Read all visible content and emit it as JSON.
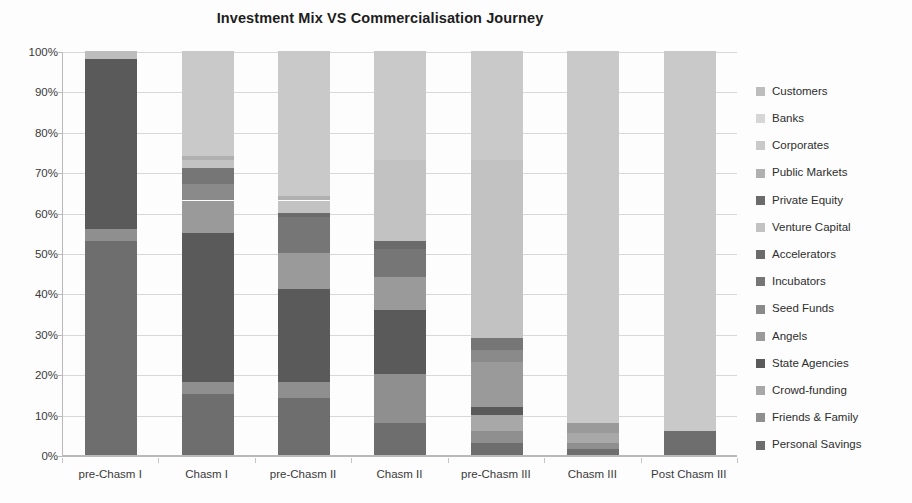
{
  "chart_data": {
    "type": "bar",
    "subtype": "100% stacked bar",
    "title": "Investment Mix VS Commercialisation Journey",
    "xlabel": "",
    "ylabel": "",
    "ylim": [
      0,
      100
    ],
    "ytick_labels": [
      "0%",
      "10%",
      "20%",
      "30%",
      "40%",
      "50%",
      "60%",
      "70%",
      "80%",
      "90%",
      "100%"
    ],
    "ytick_values": [
      0,
      10,
      20,
      30,
      40,
      50,
      60,
      70,
      80,
      90,
      100
    ],
    "grid": true,
    "legend_position": "right",
    "categories": [
      "pre-Chasm I",
      "Chasm I",
      "pre-Chasm II",
      "Chasm II",
      "pre-Chasm III",
      "Chasm III",
      "Post Chasm III"
    ],
    "series": [
      {
        "name": "Personal Savings",
        "color": "#6e6e6e",
        "values": [
          53,
          15,
          14,
          8,
          3,
          1.5,
          6
        ]
      },
      {
        "name": "Friends & Family",
        "color": "#8f8f8f",
        "values": [
          3,
          3,
          4,
          12,
          3,
          1.5,
          0
        ]
      },
      {
        "name": "Crowd-funding",
        "color": "#a8a8a8",
        "values": [
          0,
          0,
          0,
          0,
          4,
          2.5,
          0
        ]
      },
      {
        "name": "State Agencies",
        "color": "#5a5a5a",
        "values": [
          42,
          37,
          23,
          16,
          2,
          0,
          0
        ]
      },
      {
        "name": "Angels",
        "color": "#9a9a9a",
        "values": [
          0,
          8,
          9,
          8,
          11,
          2.5,
          0
        ]
      },
      {
        "name": "Seed Funds",
        "color": "#8a8a8a",
        "values": [
          0,
          4,
          0,
          0,
          3,
          0,
          0
        ]
      },
      {
        "name": "Incubators",
        "color": "#767676",
        "values": [
          0,
          4,
          9,
          7,
          3,
          0,
          0
        ]
      },
      {
        "name": "Accelerators",
        "color": "#6b6b6b",
        "values": [
          0,
          0,
          1,
          2,
          0,
          0,
          0
        ]
      },
      {
        "name": "Venture Capital",
        "color": "#c2c2c2",
        "values": [
          0,
          2,
          3,
          20,
          44,
          0,
          0
        ]
      },
      {
        "name": "Public Markets",
        "color": "#b0b0b0",
        "values": [
          0,
          1,
          1,
          0,
          0,
          0,
          0
        ]
      },
      {
        "name": "Corporates",
        "color": "#c9c9c9",
        "values": [
          0,
          26,
          36,
          27,
          27,
          92,
          94
        ]
      },
      {
        "name": "Banks",
        "color": "#d6d6d6",
        "values": [
          0,
          0,
          0,
          0,
          0,
          0,
          0
        ]
      },
      {
        "name": "Customers",
        "color": "#bdbdbd",
        "values": [
          2,
          0,
          0,
          0,
          0,
          0,
          0
        ]
      }
    ],
    "stack_order_bottom_to_top": [
      "Personal Savings",
      "Friends & Family",
      "Crowd-funding",
      "State Agencies",
      "Angels",
      "Seed Funds",
      "Incubators",
      "Accelerators",
      "Venture Capital",
      "Public Markets",
      "Corporates",
      "Banks",
      "Customers"
    ],
    "legend_entries": [
      "Customers",
      "Banks",
      "Corporates",
      "Public Markets",
      "Private Equity",
      "Venture Capital",
      "Accelerators",
      "Incubators",
      "Seed Funds",
      "Angels",
      "State Agencies",
      "Crowd-funding",
      "Friends & Family",
      "Personal Savings"
    ],
    "legend_colors": [
      "#bdbdbd",
      "#d6d6d6",
      "#c9c9c9",
      "#b0b0b0",
      "#6b6b6b",
      "#c2c2c2",
      "#6b6b6b",
      "#767676",
      "#8a8a8a",
      "#9a9a9a",
      "#5a5a5a",
      "#a8a8a8",
      "#8f8f8f",
      "#6e6e6e"
    ]
  }
}
